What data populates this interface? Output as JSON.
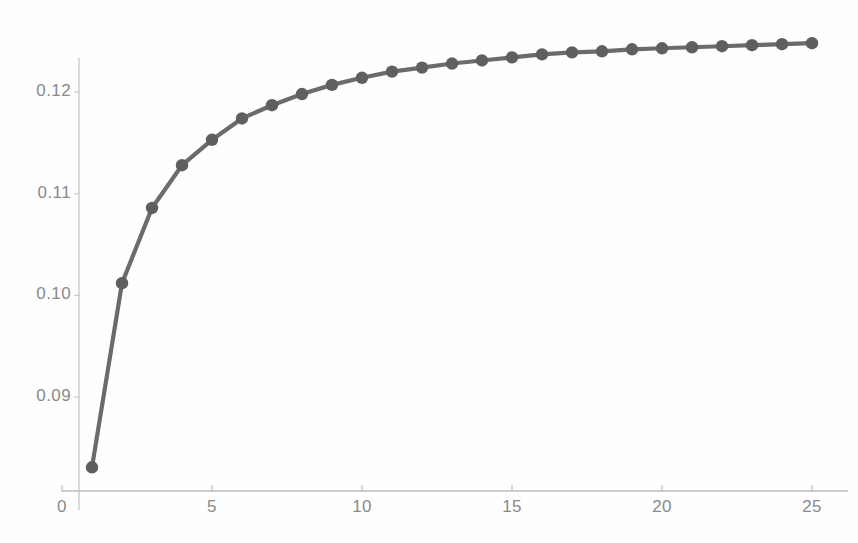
{
  "chart_data": {
    "type": "line",
    "title": "",
    "subtitle": "",
    "xlabel": "",
    "ylabel": "",
    "x": [
      1,
      2,
      3,
      4,
      5,
      6,
      7,
      8,
      9,
      10,
      11,
      12,
      13,
      14,
      15,
      16,
      17,
      18,
      19,
      20,
      21,
      22,
      23,
      24,
      25
    ],
    "values": [
      0.0831,
      0.1012,
      0.1086,
      0.1128,
      0.1153,
      0.1174,
      0.1187,
      0.1198,
      0.1207,
      0.1214,
      0.122,
      0.1224,
      0.1228,
      0.1231,
      0.1234,
      0.1237,
      0.1239,
      0.124,
      0.1242,
      0.1243,
      0.1244,
      0.1245,
      0.1246,
      0.1247,
      0.1248
    ],
    "series": [
      {
        "name": "series-1",
        "values": [
          0.0831,
          0.1012,
          0.1086,
          0.1128,
          0.1153,
          0.1174,
          0.1187,
          0.1198,
          0.1207,
          0.1214,
          0.122,
          0.1224,
          0.1228,
          0.1231,
          0.1234,
          0.1237,
          0.1239,
          0.124,
          0.1242,
          0.1243,
          0.1244,
          0.1245,
          0.1246,
          0.1247,
          0.1248
        ],
        "color": "#6b6b6b",
        "marker": "circle"
      }
    ],
    "xlim": [
      0,
      25.7
    ],
    "ylim": [
      0.0808,
      0.1253
    ],
    "xticks": [
      0,
      5,
      10,
      15,
      20,
      25
    ],
    "xtick_labels": [
      "0",
      "5",
      "10",
      "15",
      "20",
      "25"
    ],
    "yticks": [
      0.09,
      0.1,
      0.11,
      0.12
    ],
    "ytick_labels": [
      "0.09",
      "0.10",
      "0.11",
      "0.12"
    ],
    "grid": false,
    "legend": null,
    "legend_position": "none",
    "annotations": []
  },
  "style": {
    "line_color": "#6b6b6b",
    "marker_color": "#5f5f5f",
    "axis_color": "#b9b9b9",
    "tick_label_color": "#8a8a8a",
    "background_color": "#fefefe"
  },
  "axes": {
    "x_axis_name": "x-axis",
    "y_axis_name": "y-axis"
  }
}
